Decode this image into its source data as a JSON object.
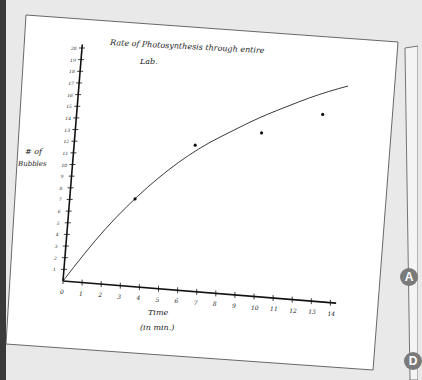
{
  "chart_data": {
    "type": "scatter",
    "title": "Rate of Photosynthesis through entire Lab.",
    "xlabel": "Time (in min.)",
    "ylabel": "# of Bubbles",
    "xlim": [
      0,
      14
    ],
    "ylim": [
      0,
      20
    ],
    "x_ticks": [
      "0",
      "1",
      "2",
      "3",
      "4",
      "5",
      "6",
      "7",
      "8",
      "9",
      "10",
      "11",
      "12",
      "13",
      "14"
    ],
    "y_ticks": [
      "1",
      "2",
      "3",
      "4",
      "5",
      "6",
      "7",
      "8",
      "9",
      "10",
      "11",
      "12",
      "13",
      "14",
      "15",
      "16",
      "17",
      "18",
      "19",
      "20"
    ],
    "grid": false,
    "series": [
      {
        "name": "measured",
        "points": [
          [
            3.4,
            7.5
          ],
          [
            6.3,
            12.5
          ],
          [
            9.7,
            14
          ],
          [
            12.8,
            16
          ]
        ]
      },
      {
        "name": "trend curve (hand drawn)",
        "points": [
          [
            0,
            0
          ],
          [
            1,
            2.5
          ],
          [
            2,
            4.8
          ],
          [
            3,
            6.8
          ],
          [
            4,
            8.6
          ],
          [
            5,
            10.2
          ],
          [
            6,
            11.6
          ],
          [
            7,
            12.8
          ],
          [
            8,
            13.8
          ],
          [
            9,
            14.8
          ],
          [
            10,
            15.7
          ],
          [
            11,
            16.5
          ],
          [
            12,
            17.3
          ],
          [
            13,
            18.0
          ],
          [
            14,
            18.6
          ]
        ]
      }
    ],
    "legend": "none"
  },
  "labels": {
    "title_line1": "Rate of   Photosynthesis   through  entire",
    "title_line2": "Lab.",
    "ylabel_line1": "# of",
    "ylabel_line2": "Bubbles",
    "xlabel_line1": "Time",
    "xlabel_line2": "(in  min.)"
  },
  "side_markers": [
    "A",
    "D"
  ]
}
